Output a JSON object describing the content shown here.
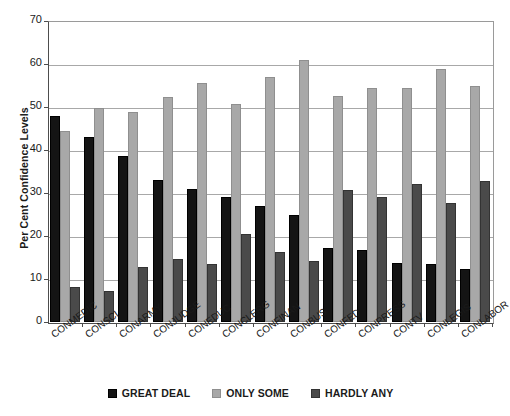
{
  "chart_data": {
    "type": "bar",
    "title": "",
    "subtitle": "",
    "xlabel": "",
    "ylabel": "Per Cent Confidence Levels",
    "ylim": [
      0,
      70
    ],
    "yticks": [
      0,
      10,
      20,
      30,
      40,
      50,
      60,
      70
    ],
    "ytick_labels": [
      "0",
      "10",
      "20",
      "30",
      "40",
      "50",
      "60",
      "70"
    ],
    "grid": true,
    "legend_position": "bottom",
    "categories": [
      "CONMEDIC",
      "CONSCI",
      "CONARMY",
      "CONJUDGE",
      "CONEDUC",
      "CONCLERG",
      "CONFINAN",
      "CONBUS",
      "CONFED",
      "CONPRESS",
      "CONTV",
      "CONLEGIS",
      "CONLABOR"
    ],
    "series": [
      {
        "name": "GREAT DEAL",
        "color": "#141414",
        "values": [
          47.8,
          43.0,
          38.7,
          33.0,
          31.0,
          29.0,
          26.9,
          25.0,
          17.2,
          16.8,
          13.8,
          13.5,
          12.4
        ]
      },
      {
        "name": "ONLY SOME",
        "color": "#a8a8a8",
        "values": [
          44.5,
          49.8,
          48.8,
          52.4,
          55.6,
          50.8,
          57.0,
          60.9,
          52.5,
          54.4,
          54.4,
          58.9,
          55.0
        ]
      },
      {
        "name": "HARDLY ANY",
        "color": "#4a4a4a",
        "values": [
          8.2,
          7.3,
          12.7,
          14.7,
          13.4,
          20.5,
          16.3,
          14.3,
          30.6,
          29.0,
          32.2,
          27.6,
          32.8
        ]
      }
    ]
  }
}
